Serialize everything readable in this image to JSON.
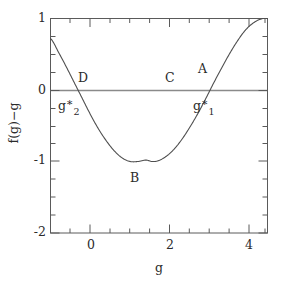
{
  "chart_data": {
    "type": "line",
    "title": "",
    "xlabel": "g",
    "ylabel": "f(g)−g",
    "xlim": [
      -1.0,
      4.45
    ],
    "ylim": [
      -2.0,
      1.0
    ],
    "grid": false,
    "legend": null,
    "x_ticks_major": [
      0,
      2,
      4
    ],
    "x_tick_labels": [
      "0",
      "2",
      "4"
    ],
    "x_ticks_minor": [
      -0.5,
      0.5,
      1.0,
      1.5,
      2.5,
      3.0,
      3.5,
      4.5
    ],
    "y_ticks_major": [
      -2,
      -1,
      0,
      1
    ],
    "y_tick_labels": [
      "-2",
      "-1",
      "0",
      "1"
    ],
    "y_ticks_minor": [
      -1.75,
      -1.5,
      -1.25,
      -0.75,
      -0.5,
      -0.25,
      0.25,
      0.5,
      0.75
    ],
    "series": [
      {
        "name": "f(g)-g",
        "description": "cosine-like curve: minimum -1 near g=1.55, rising to +1 near g=4.35",
        "x": [
          -1.0,
          -0.8,
          -0.6,
          -0.4,
          -0.2,
          0.0,
          0.2,
          0.4,
          0.6,
          0.8,
          1.0,
          1.2,
          1.4,
          1.55,
          1.7,
          1.9,
          2.1,
          2.3,
          2.5,
          2.7,
          2.9,
          3.1,
          3.3,
          3.5,
          3.7,
          3.9,
          4.1,
          4.3,
          4.45
        ],
        "y": [
          0.72,
          0.53,
          0.32,
          0.1,
          -0.12,
          -0.34,
          -0.54,
          -0.71,
          -0.85,
          -0.95,
          -1.0,
          -1.0,
          -0.98,
          -1.0,
          -0.99,
          -0.93,
          -0.83,
          -0.69,
          -0.52,
          -0.33,
          -0.12,
          0.1,
          0.31,
          0.51,
          0.69,
          0.84,
          0.94,
          0.995,
          1.0
        ]
      }
    ],
    "reference_lines": [
      {
        "name": "zero-line",
        "orientation": "horizontal",
        "value": 0
      }
    ],
    "annotations": [
      {
        "id": "A",
        "text": "A",
        "x": 3.85,
        "y": 0.3
      },
      {
        "id": "B",
        "text": "B",
        "x": 1.55,
        "y": -1.33
      },
      {
        "id": "C",
        "text": "C",
        "x": 2.85,
        "y": 0.19
      },
      {
        "id": "D",
        "text": "D",
        "x": 0.45,
        "y": 0.19
      },
      {
        "id": "gstar1",
        "text": "g*1",
        "base": "g",
        "star": "∗",
        "sub": "1",
        "x": 3.0,
        "y": -0.25
      },
      {
        "id": "gstar2",
        "text": "g*2",
        "base": "g",
        "star": "∗",
        "sub": "2",
        "x": -0.55,
        "y": -0.25
      }
    ]
  },
  "axes": {
    "x_title": "g",
    "y_title": "f(g)−g",
    "x_tick_labels": [
      "0",
      "2",
      "4"
    ],
    "y_tick_labels": [
      "1",
      "0",
      "-1",
      "-2"
    ]
  },
  "labels": {
    "A": "A",
    "B": "B",
    "C": "C",
    "D": "D",
    "gstar1_base": "g",
    "gstar1_star": "∗",
    "gstar1_sub": "1",
    "gstar2_base": "g",
    "gstar2_star": "∗",
    "gstar2_sub": "2"
  },
  "colors": {
    "curve": "#4f4f4f",
    "axis": "#5a5a5a",
    "zero_line": "#8a8a8a",
    "text": "#2b2b2b",
    "background": "#ffffff"
  }
}
